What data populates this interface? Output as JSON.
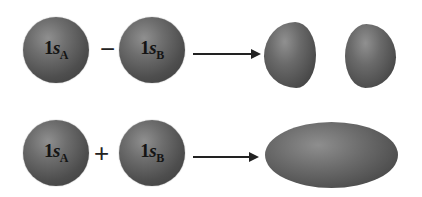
{
  "diagram": {
    "type": "molecular-orbital-formation",
    "rows": [
      {
        "name": "antibonding",
        "left_orbital": {
          "label": "1s",
          "subscript": "A"
        },
        "operator": "−",
        "right_orbital": {
          "label": "1s",
          "subscript": "B"
        },
        "result_shape": "two separated lobes"
      },
      {
        "name": "bonding",
        "left_orbital": {
          "label": "1s",
          "subscript": "A"
        },
        "operator": "+",
        "right_orbital": {
          "label": "1s",
          "subscript": "B"
        },
        "result_shape": "single elongated ellipsoid"
      }
    ],
    "colors": {
      "orbital": "#5a5a5a",
      "text": "#141414",
      "arrow": "#222222",
      "background": "#ffffff"
    }
  }
}
